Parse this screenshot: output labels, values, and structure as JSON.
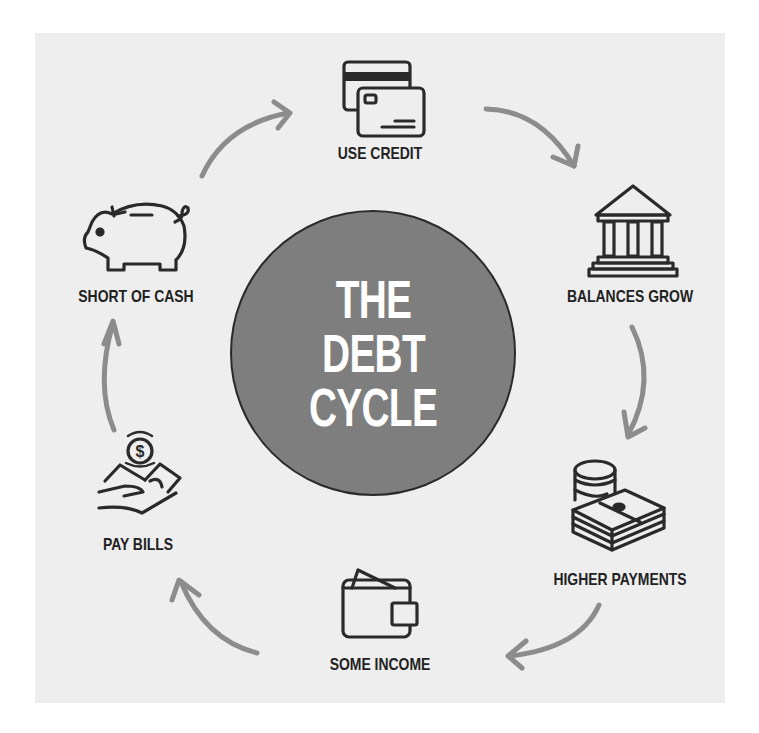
{
  "diagram": {
    "title_lines": [
      "THE",
      "DEBT",
      "CYCLE"
    ],
    "colors": {
      "panel_bg": "#eeeeee",
      "circle_fill": "#7e7e7e",
      "circle_stroke": "#2a2a2a",
      "title_text": "#ffffff",
      "label_text": "#222222",
      "icon_stroke": "#2a2a2a",
      "arrow": "#8c8c8c"
    },
    "steps": [
      {
        "label": "USE CREDIT",
        "icon": "credit-cards-icon"
      },
      {
        "label": "BALANCES GROW",
        "icon": "bank-building-icon"
      },
      {
        "label": "HIGHER PAYMENTS",
        "icon": "coins-and-cash-stack-icon"
      },
      {
        "label": "SOME INCOME",
        "icon": "wallet-icon"
      },
      {
        "label": "PAY BILLS",
        "icon": "hand-with-money-icon"
      },
      {
        "label": "SHORT OF CASH",
        "icon": "piggy-bank-icon"
      }
    ],
    "arrows": [
      {
        "from": "USE CREDIT",
        "to": "BALANCES GROW"
      },
      {
        "from": "BALANCES GROW",
        "to": "HIGHER PAYMENTS"
      },
      {
        "from": "HIGHER PAYMENTS",
        "to": "SOME INCOME"
      },
      {
        "from": "SOME INCOME",
        "to": "PAY BILLS"
      },
      {
        "from": "PAY BILLS",
        "to": "SHORT OF CASH"
      },
      {
        "from": "SHORT OF CASH",
        "to": "USE CREDIT"
      }
    ]
  }
}
